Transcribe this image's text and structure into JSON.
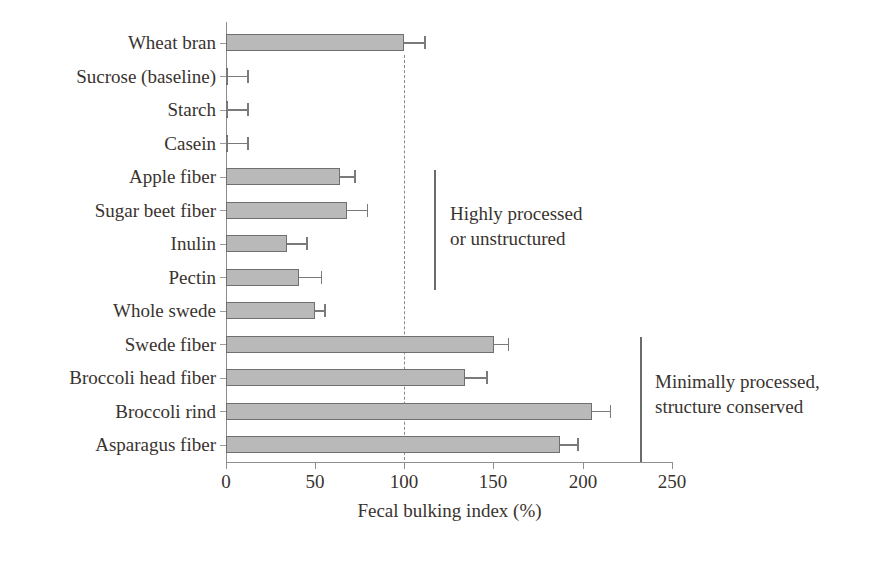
{
  "chart_data": {
    "type": "bar",
    "orientation": "horizontal",
    "title": "",
    "xlabel": "Fecal bulking index (%)",
    "ylabel": "",
    "xlim": [
      0,
      250
    ],
    "xticks": [
      0,
      50,
      100,
      150,
      200,
      250
    ],
    "grid": false,
    "legend": null,
    "reference_line": {
      "value": 100,
      "style": "dashed",
      "label": ""
    },
    "categories": [
      "Wheat bran",
      "Sucrose (baseline)",
      "Starch",
      "Casein",
      "Apple fiber",
      "Sugar beet fiber",
      "Inulin",
      "Pectin",
      "Whole swede",
      "Swede fiber",
      "Broccoli head fiber",
      "Broccoli rind",
      "Asparagus fiber"
    ],
    "values": [
      100,
      1,
      1,
      1,
      64,
      68,
      34,
      41,
      50,
      150,
      134,
      205,
      187
    ],
    "errors_upper": [
      11,
      11,
      11,
      11,
      8,
      11,
      11,
      12,
      5,
      8,
      12,
      10,
      10
    ],
    "annotations": [
      {
        "text_line1": "Highly processed",
        "text_line2": "or unstructured",
        "covers": [
          "Apple fiber",
          "Sugar beet fiber",
          "Inulin",
          "Pectin"
        ]
      },
      {
        "text_line1": "Minimally processed,",
        "text_line2": "structure conserved",
        "covers": [
          "Swede fiber",
          "Broccoli head fiber",
          "Broccoli rind",
          "Asparagus fiber"
        ]
      }
    ],
    "colors": {
      "bar_fill": "#b9b9b9",
      "bar_edge": "#6f6f6f",
      "axis": "#8d8d8d",
      "text": "#39332f",
      "error_bar": "#7a7a7a",
      "reference_line": "#8a8a8a",
      "bracket": "#6b6b6b",
      "background": "#ffffff"
    }
  },
  "axis": {
    "x_title": "Fecal bulking index (%)",
    "tick_0": "0",
    "tick_1": "50",
    "tick_2": "100",
    "tick_3": "150",
    "tick_4": "200",
    "tick_5": "250"
  },
  "categories": {
    "c0": "Wheat bran",
    "c1": "Sucrose (baseline)",
    "c2": "Starch",
    "c3": "Casein",
    "c4": "Apple fiber",
    "c5": "Sugar beet fiber",
    "c6": "Inulin",
    "c7": "Pectin",
    "c8": "Whole swede",
    "c9": "Swede fiber",
    "c10": "Broccoli head fiber",
    "c11": "Broccoli rind",
    "c12": "Asparagus fiber"
  },
  "annotations": {
    "group1_line1": "Highly processed",
    "group1_line2": "or unstructured",
    "group2_line1": "Minimally processed,",
    "group2_line2": "structure conserved"
  }
}
